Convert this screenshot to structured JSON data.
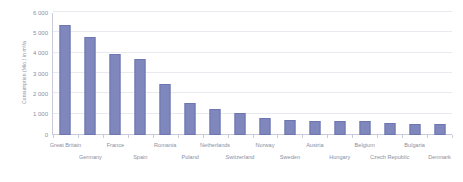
{
  "chart_data": {
    "type": "bar",
    "title": "",
    "subtitle": "",
    "xlabel": "",
    "ylabel": "Consumption (Mio.) in m³/a",
    "ylim": [
      0,
      6000
    ],
    "y_ticks": [
      0,
      1000,
      2000,
      3000,
      4000,
      5000,
      6000
    ],
    "y_tick_labels": [
      "0",
      "1 000",
      "2 000",
      "3 000",
      "4 000",
      "5 000",
      "6 000"
    ],
    "grid": true,
    "legend": null,
    "bar_color": "#7f87bd",
    "bar_border_color": "#6d76b0",
    "axis_color": "#c9ccd8",
    "gridline_color": "#e9eaf0",
    "text_color": "#8a8fa3",
    "categories": [
      "Great Britain",
      "Germany",
      "France",
      "Spain",
      "Romania",
      "Poland",
      "Netherlands",
      "Switzerland",
      "Norway",
      "Sweden",
      "Austria",
      "Hungary",
      "Belgium",
      "Czech Republic",
      "Bulgaria",
      "Denmark"
    ],
    "values": [
      5400,
      4800,
      4000,
      3750,
      2500,
      1550,
      1300,
      1100,
      840,
      760,
      690,
      680,
      700,
      610,
      560,
      540
    ]
  }
}
